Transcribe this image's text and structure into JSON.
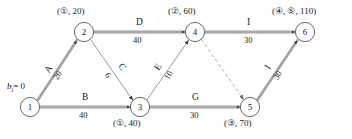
{
  "diagram": {
    "type": "network-cpm",
    "bi_label": "b",
    "bi_sub": "i",
    "bi_value": "= 0",
    "nodes": [
      {
        "id": "1",
        "label": "1",
        "x": 30,
        "y": 107,
        "annotation": "",
        "annotation_pos": ""
      },
      {
        "id": "2",
        "label": "2",
        "x": 84,
        "y": 32,
        "annotation": "(①, 20)",
        "annotation_pos": "top"
      },
      {
        "id": "3",
        "label": "3",
        "x": 140,
        "y": 107,
        "annotation": "(①, 40)",
        "annotation_pos": "bottom"
      },
      {
        "id": "4",
        "label": "4",
        "x": 195,
        "y": 32,
        "annotation": "(②, 60)",
        "annotation_pos": "top"
      },
      {
        "id": "5",
        "label": "5",
        "x": 250,
        "y": 107,
        "annotation": "(③, 70)",
        "annotation_pos": "bottom"
      },
      {
        "id": "6",
        "label": "6",
        "x": 305,
        "y": 32,
        "annotation": "(④, ⑤, 110)",
        "annotation_pos": "top"
      }
    ],
    "edges": [
      {
        "name": "A",
        "duration": "20",
        "from": "1",
        "to": "2",
        "style": "double",
        "orientation": "diagonal-up"
      },
      {
        "name": "B",
        "duration": "40",
        "from": "1",
        "to": "3",
        "style": "double",
        "orientation": "horizontal"
      },
      {
        "name": "C",
        "duration": "6",
        "from": "2",
        "to": "3",
        "style": "thin",
        "orientation": "diagonal-down"
      },
      {
        "name": "D",
        "duration": "40",
        "from": "2",
        "to": "4",
        "style": "double",
        "orientation": "horizontal"
      },
      {
        "name": "E",
        "duration": "10",
        "from": "3",
        "to": "4",
        "style": "thin",
        "orientation": "diagonal-up"
      },
      {
        "name": "G",
        "duration": "30",
        "from": "3",
        "to": "5",
        "style": "double",
        "orientation": "horizontal"
      },
      {
        "name": "H",
        "duration": "40",
        "from": "4",
        "to": "6",
        "style": "double",
        "orientation": "horizontal"
      },
      {
        "name": "I",
        "duration": "30",
        "from": "5",
        "to": "6",
        "style": "double",
        "orientation": "diagonal-up"
      },
      {
        "name": "",
        "duration": "",
        "from": "4",
        "to": "5",
        "style": "dashed",
        "orientation": "diagonal-down"
      }
    ],
    "colors": {
      "line": "#8c8c8c",
      "line_dark": "#3a3a3a",
      "text": "#1a1a1a",
      "node_fill": "#ffffff",
      "dashed": "#9a9a9a"
    }
  }
}
